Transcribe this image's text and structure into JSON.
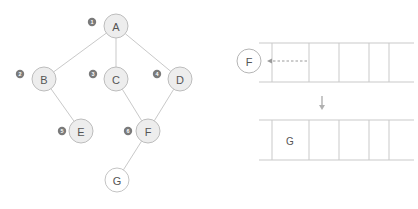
{
  "diagram": {
    "type": "graph-traversal-with-stack",
    "colors": {
      "node_fill": "#ededed",
      "node_fill_unvisited": "#ffffff",
      "node_stroke": "#bdbdbd",
      "edge_stroke": "#c9c9c9",
      "badge_fill": "#7a7a7a",
      "badge_text": "#ffffff",
      "label_text": "#555555",
      "arrow_stroke": "#9a9a9a",
      "down_arrow_stroke": "#b0b0b0",
      "background": "#ffffff"
    }
  },
  "graph": {
    "nodes": [
      {
        "id": "A",
        "label": "A",
        "order": "1",
        "cx": 116,
        "cy": 26,
        "r": 12,
        "visited": true,
        "badge_x": 92,
        "badge_y": 22
      },
      {
        "id": "B",
        "label": "B",
        "order": "2",
        "cx": 44,
        "cy": 79,
        "r": 12,
        "visited": true,
        "badge_x": 20,
        "badge_y": 74
      },
      {
        "id": "C",
        "label": "C",
        "order": "3",
        "cx": 116,
        "cy": 79,
        "r": 12,
        "visited": true,
        "badge_x": 93,
        "badge_y": 74
      },
      {
        "id": "D",
        "label": "D",
        "order": "4",
        "cx": 180,
        "cy": 79,
        "r": 12,
        "visited": true,
        "badge_x": 157,
        "badge_y": 74
      },
      {
        "id": "E",
        "label": "E",
        "order": "5",
        "cx": 81,
        "cy": 131,
        "r": 12,
        "visited": true,
        "badge_x": 62,
        "badge_y": 131
      },
      {
        "id": "F",
        "label": "F",
        "order": "6",
        "cx": 148,
        "cy": 131,
        "r": 12,
        "visited": true,
        "badge_x": 128,
        "badge_y": 131
      },
      {
        "id": "G",
        "label": "G",
        "order": "",
        "cx": 117,
        "cy": 180,
        "r": 12,
        "visited": false,
        "badge_x": null,
        "badge_y": null
      }
    ],
    "edges": [
      {
        "from": "A",
        "to": "B"
      },
      {
        "from": "A",
        "to": "C"
      },
      {
        "from": "A",
        "to": "D"
      },
      {
        "from": "B",
        "to": "E"
      },
      {
        "from": "C",
        "to": "F"
      },
      {
        "from": "D",
        "to": "F"
      },
      {
        "from": "F",
        "to": "G"
      }
    ]
  },
  "stack_panel": {
    "popped_node": {
      "label": "F",
      "cx": 40,
      "cy": 61,
      "r": 12
    },
    "arrow": {
      "x_from": 98,
      "x_to": 58,
      "y": 61,
      "style": "dashed",
      "direction": "left"
    },
    "transition_arrow": {
      "x": 113,
      "y_from": 96,
      "y_to": 110,
      "direction": "down"
    },
    "top_row": {
      "y_top": 43,
      "y_bottom": 82,
      "rail_x_start": 50,
      "rail_x_end": 205,
      "dividers": [
        63,
        100,
        130,
        160,
        180
      ],
      "cells": [
        "",
        "",
        "",
        ""
      ]
    },
    "bottom_row": {
      "y_top": 120,
      "y_bottom": 160,
      "rail_x_start": 50,
      "rail_x_end": 205,
      "dividers": [
        63,
        100,
        130,
        160,
        180
      ],
      "cells": [
        {
          "label": "G",
          "cx": 81,
          "cy": 141
        },
        {
          "label": "",
          "cx": 115,
          "cy": 141
        },
        {
          "label": "",
          "cx": 145,
          "cy": 141
        },
        {
          "label": "",
          "cx": 170,
          "cy": 141
        }
      ]
    }
  }
}
